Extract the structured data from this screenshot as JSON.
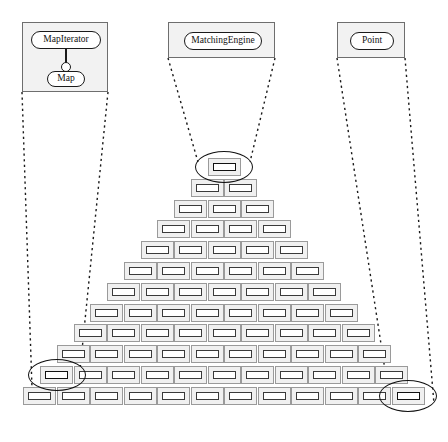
{
  "diagram": {
    "background": "#ffffff",
    "panel_fill": "#f2f2f2",
    "panel_stroke": "#6e6e6e",
    "node_fill": "#f0f0f0",
    "node_stroke": "#9a9a9a",
    "node_inner_stroke": "#3a3a3a",
    "highlight_stroke": "#111111",
    "callout_stroke": "#1a1a1a",
    "callout_style": "dotted"
  },
  "panels": [
    {
      "id": "panel-mapiterator",
      "name": "map-iterator-panel",
      "x": 22,
      "y": 22,
      "w": 86,
      "h": 70,
      "classes": [
        {
          "label": "MapIterator",
          "shape": "rounded-rect"
        },
        {
          "label": "Map",
          "shape": "rounded-rect"
        }
      ],
      "connector": {
        "type": "lollipop",
        "from": "MapIterator",
        "to": "Map"
      }
    },
    {
      "id": "panel-matchingengine",
      "name": "matching-engine-panel",
      "x": 168,
      "y": 22,
      "w": 107,
      "h": 36,
      "classes": [
        {
          "label": "MatchingEngine",
          "shape": "rounded-rect"
        }
      ],
      "connector": null
    },
    {
      "id": "panel-point",
      "name": "point-panel",
      "x": 337,
      "y": 22,
      "w": 68,
      "h": 36,
      "classes": [
        {
          "label": "Point",
          "shape": "rounded-rect"
        }
      ],
      "connector": null
    }
  ],
  "pyramid": {
    "rows": 12,
    "row_counts": [
      1,
      2,
      3,
      4,
      5,
      6,
      7,
      8,
      9,
      10,
      11,
      12
    ],
    "node_width": 33,
    "node_height": 18,
    "col_pitch": 33.5,
    "row_pitch": 20.8,
    "top_y": 158,
    "center_x": 224,
    "node_label": ""
  },
  "highlights": [
    {
      "name": "highlight-top-node",
      "row": 1,
      "index": 0,
      "cx": 224,
      "cy": 167,
      "rx": 29,
      "ry": 16
    },
    {
      "name": "highlight-left-node",
      "row": 11,
      "index": 0,
      "cx": 55,
      "cy": 386,
      "rx": 29,
      "ry": 16
    },
    {
      "name": "highlight-bottom-right-node",
      "row": 12,
      "index": 11,
      "cx": 408,
      "cy": 407,
      "rx": 29,
      "ry": 16
    }
  ],
  "callouts": [
    {
      "name": "callout-mapiterator",
      "from_panel": "panel-mapiterator",
      "to_highlight": "highlight-left-node",
      "lines": [
        {
          "x1": 22,
          "y1": 92,
          "x2": 32,
          "y2": 388
        },
        {
          "x1": 108,
          "y1": 92,
          "x2": 80,
          "y2": 370
        }
      ]
    },
    {
      "name": "callout-matchingengine",
      "from_panel": "panel-matchingengine",
      "to_highlight": "highlight-top-node",
      "lines": [
        {
          "x1": 168,
          "y1": 58,
          "x2": 198,
          "y2": 162
        },
        {
          "x1": 275,
          "y1": 58,
          "x2": 250,
          "y2": 162
        }
      ]
    },
    {
      "name": "callout-point",
      "from_panel": "panel-point",
      "to_highlight": "highlight-bottom-right-node",
      "lines": [
        {
          "x1": 337,
          "y1": 58,
          "x2": 385,
          "y2": 370
        },
        {
          "x1": 405,
          "y1": 58,
          "x2": 434,
          "y2": 404
        }
      ]
    }
  ]
}
